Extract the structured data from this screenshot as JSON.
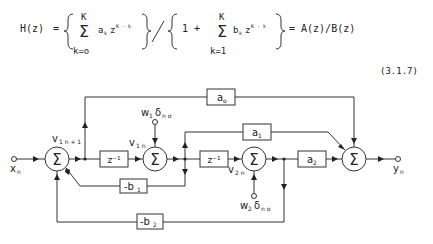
{
  "equation": {
    "lhs": "H(z)",
    "eq": "=",
    "num_sum_top": "K",
    "num_sum_bottom": "k=o",
    "num_term_a": "a",
    "num_term_a_sub": "k",
    "num_term_z": "z",
    "num_term_z_sup": "K - k",
    "slash": "/",
    "den_one": "1  +",
    "den_sum_top": "K",
    "den_sum_bottom": "k=1",
    "den_term_b": "b",
    "den_term_b_sub": "k",
    "den_term_z": "z",
    "den_term_z_sup": "K - k",
    "rhs": "= A(z)/B(z)",
    "number": "(3.1.7)"
  },
  "diagram": {
    "sum_symbol": "Σ",
    "input_label": "x",
    "input_sub": "n",
    "output_label": "y",
    "output_sub": "n",
    "v1n1_label": "v",
    "v1n1_sub": "1 n + 1",
    "v1n_label": "v",
    "v1n_sub": "1 n",
    "v2n_label": "v",
    "v2n_sub": "2 n",
    "w1_label": "w",
    "w1_sub": "1",
    "w1_delta": "δ",
    "w1_delta_sub": "n o",
    "w2_label": "w",
    "w2_sub": "2",
    "w2_delta": "δ",
    "w2_delta_sub": "n o",
    "delay1": "z⁻¹",
    "delay2": "z⁻¹",
    "a0": "a",
    "a0_sub": "o",
    "a1": "a",
    "a1_sub": "1",
    "a2": "a",
    "a2_sub": "2",
    "b1": "-b",
    "b1_sub": "1",
    "b2": "-b",
    "b2_sub": "2"
  }
}
